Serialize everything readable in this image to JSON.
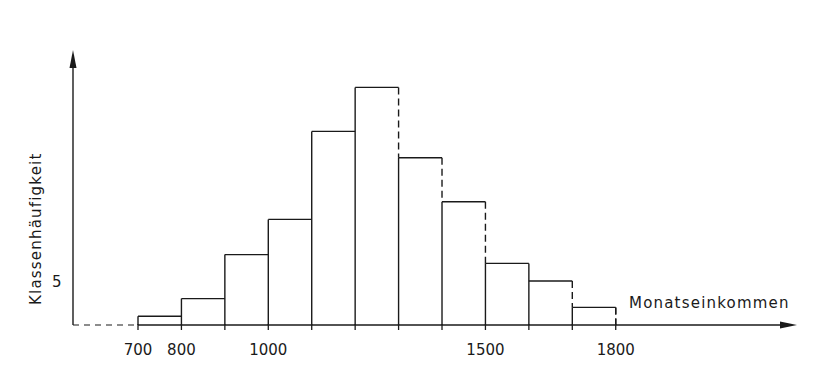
{
  "chart_data": {
    "type": "bar",
    "subtype": "histogram",
    "title": "",
    "xlabel": "Monatseinkommen",
    "ylabel": "Klassenhäufigkeit",
    "x_tick_labels": [
      "700",
      "800",
      "1000",
      "1500",
      "1800"
    ],
    "y_tick_labels": [
      "5"
    ],
    "bin_edges": [
      700,
      800,
      900,
      1000,
      1100,
      1200,
      1300,
      1400,
      1500,
      1600,
      1700,
      1800
    ],
    "categories": [
      "700-800",
      "800-900",
      "900-1000",
      "1000-1100",
      "1100-1200",
      "1200-1300",
      "1300-1400",
      "1400-1500",
      "1500-1600",
      "1600-1700",
      "1700-1800"
    ],
    "values": [
      1,
      3,
      8,
      12,
      22,
      27,
      19,
      14,
      7,
      5,
      2
    ],
    "dashed_right_edges": [
      false,
      false,
      false,
      false,
      false,
      true,
      true,
      true,
      false,
      true,
      true
    ],
    "xlim": [
      600,
      2000
    ],
    "ylim": [
      0,
      30
    ],
    "grid": false,
    "legend": null,
    "axis_break": "dashed x-axis segment between origin and 700"
  },
  "colors": {
    "ink": "#1a1a1a",
    "background": "#ffffff"
  }
}
